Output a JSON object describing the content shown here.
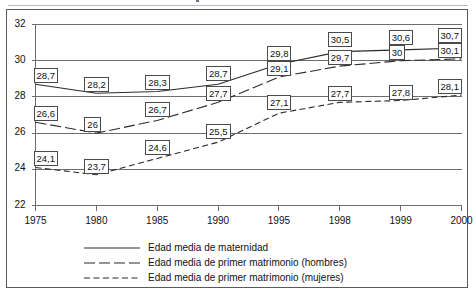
{
  "chart_data": {
    "type": "line",
    "title": "",
    "xlabel": "",
    "ylabel": "",
    "x": [
      "1975",
      "1980",
      "1985",
      "1990",
      "1995",
      "1998",
      "1999",
      "2000"
    ],
    "categories": [
      "1975",
      "1980",
      "1985",
      "1990",
      "1995",
      "1998",
      "1999",
      "2000"
    ],
    "xtick_labels": [
      "1975",
      "1980",
      "1985",
      "1990",
      "1995",
      "1998",
      "1999",
      "2000"
    ],
    "ytick_labels": [
      "32",
      "30",
      "28",
      "26",
      "24",
      "22"
    ],
    "yticks": [
      32,
      30,
      28,
      26,
      24,
      22
    ],
    "ylim": [
      22,
      32
    ],
    "grid": "horizontal",
    "legend_position": "bottom",
    "series": [
      {
        "name": "Edad media de maternidad",
        "line_style": "solid",
        "values": [
          28.7,
          28.2,
          28.3,
          28.7,
          29.8,
          30.5,
          30.6,
          30.7
        ],
        "labels": [
          "28,7",
          "28,2",
          "28,3",
          "28,7",
          "29,8",
          "30,5",
          "30,6",
          "30,7"
        ]
      },
      {
        "name": "Edad media de primer matrimonio (hombres)",
        "line_style": "long-dash",
        "values": [
          26.6,
          26.0,
          26.7,
          27.7,
          29.1,
          29.7,
          30.0,
          30.1
        ],
        "labels": [
          "26,6",
          "26",
          "26,7",
          "27,7",
          "29,1",
          "29,7",
          "30",
          "30,1"
        ]
      },
      {
        "name": "Edad media de primer matrimonio (mujeres)",
        "line_style": "short-dash",
        "values": [
          24.1,
          23.7,
          24.6,
          25.5,
          27.1,
          27.7,
          27.8,
          28.1
        ],
        "labels": [
          "24,1",
          "23,7",
          "24,6",
          "25,5",
          "27,1",
          "27,7",
          "27,8",
          "28,1"
        ]
      }
    ]
  },
  "legend": {
    "items": [
      {
        "label": "Edad media de maternidad",
        "style": "solid"
      },
      {
        "label": "Edad media de primer matrimonio (hombres)",
        "style": "long-dash"
      },
      {
        "label": "Edad media de primer matrimonio (mujeres)",
        "style": "short-dash"
      }
    ]
  },
  "colors": {
    "line": "#2b2b2b",
    "grid": "#6d6d6d",
    "frame": "#5a5a5a",
    "text": "#111111",
    "background": "#ffffff"
  }
}
